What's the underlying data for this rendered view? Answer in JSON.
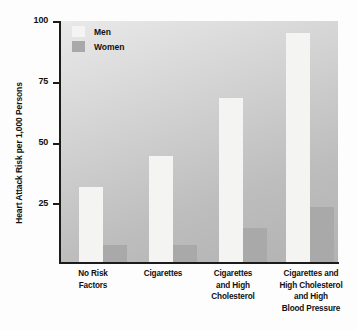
{
  "chart_data": {
    "type": "bar",
    "title": "",
    "xlabel": "",
    "ylabel": "Heart Attack Risk per 1,000 Persons",
    "ylim": [
      0,
      100
    ],
    "yticks": [
      25,
      50,
      75,
      100
    ],
    "grid": false,
    "legend_position": "top-left",
    "categories": [
      "No Risk Factors",
      "Cigarettes",
      "Cigarettes and High Cholesterol",
      "Cigarettes and High Cholesterol and High Blood Pressure"
    ],
    "category_lines": [
      [
        "No Risk",
        "Factors"
      ],
      [
        "Cigarettes"
      ],
      [
        "Cigarettes",
        "and High",
        "Cholesterol"
      ],
      [
        "Cigarettes and",
        "High Cholesterol",
        "and High",
        "Blood Pressure"
      ]
    ],
    "series": [
      {
        "name": "Men",
        "color": "#f4f4f2",
        "values": [
          31,
          44,
          68,
          95
        ]
      },
      {
        "name": "Women",
        "color": "#a9a9a9",
        "values": [
          7,
          7,
          14,
          23
        ]
      }
    ]
  },
  "legend": {
    "items": [
      {
        "label": "Men"
      },
      {
        "label": "Women"
      }
    ]
  },
  "axis": {
    "y_tick_labels": [
      "100",
      "75",
      "50",
      "25"
    ]
  }
}
